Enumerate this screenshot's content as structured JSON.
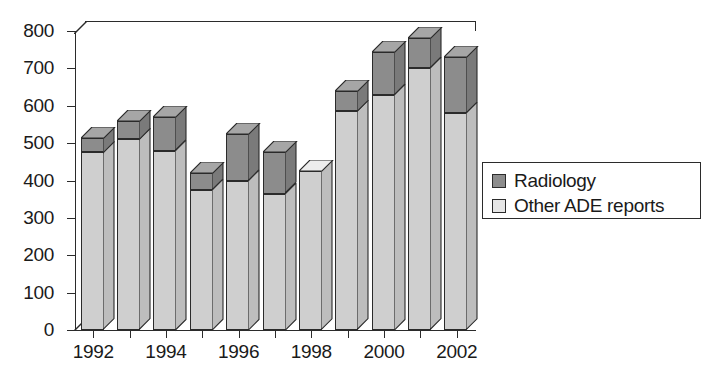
{
  "chart_data": {
    "type": "bar",
    "stacked": true,
    "title": "",
    "xlabel": "",
    "ylabel": "",
    "ylim": [
      0,
      800
    ],
    "ytick_values": [
      0,
      100,
      200,
      300,
      400,
      500,
      600,
      700,
      800
    ],
    "ytick_labels": [
      "0",
      "100",
      "200",
      "300",
      "400",
      "500",
      "600",
      "700",
      "800"
    ],
    "grid": false,
    "legend_position": "right",
    "categories": [
      "1992",
      "1993",
      "1994",
      "1995",
      "1996",
      "1997",
      "1998",
      "1999",
      "2000",
      "2001",
      "2002"
    ],
    "xtick_labels": [
      "1992",
      "1994",
      "1996",
      "1998",
      "2000",
      "2002"
    ],
    "series": [
      {
        "name": "Other ADE reports",
        "color": "#cfcfcf",
        "values": [
          475,
          510,
          480,
          375,
          400,
          365,
          425,
          585,
          630,
          700,
          580
        ]
      },
      {
        "name": "Radiology",
        "color": "#8c8c8c",
        "values": [
          40,
          50,
          90,
          45,
          125,
          110,
          0,
          55,
          115,
          80,
          150
        ]
      }
    ],
    "totals": [
      515,
      560,
      570,
      420,
      525,
      475,
      425,
      640,
      745,
      780,
      730
    ]
  },
  "legend": {
    "items": [
      {
        "label": "Radiology",
        "swatch": "dark"
      },
      {
        "label": "Other ADE reports",
        "swatch": "light"
      }
    ]
  }
}
